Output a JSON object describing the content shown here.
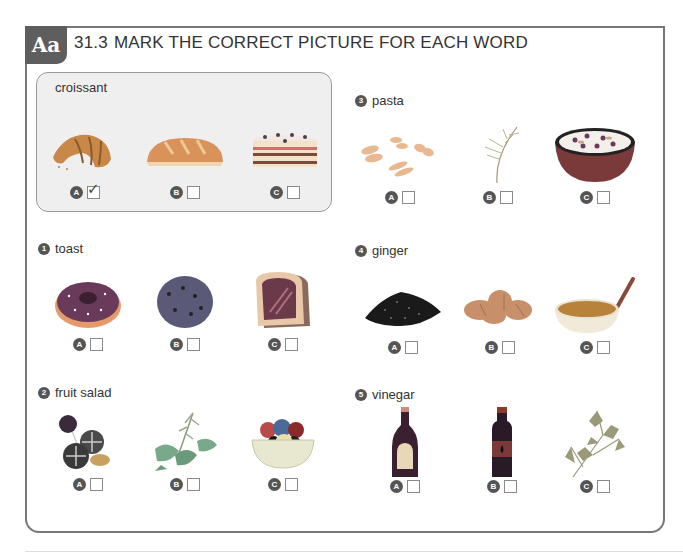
{
  "header": {
    "badge": "Aa",
    "exercise_number": "31.3",
    "instruction": "MARK THE CORRECT PICTURE FOR EACH WORD"
  },
  "example": {
    "word": "croissant",
    "options": [
      {
        "letter": "A",
        "image": "croissant",
        "checked": true
      },
      {
        "letter": "B",
        "image": "bread-loaf",
        "checked": false
      },
      {
        "letter": "C",
        "image": "layer-cake",
        "checked": false
      }
    ],
    "check_mark": "✓"
  },
  "questions": [
    {
      "number": "1",
      "word": "toast",
      "options": [
        {
          "letter": "A",
          "image": "donut",
          "checked": false
        },
        {
          "letter": "B",
          "image": "cookie",
          "checked": false
        },
        {
          "letter": "C",
          "image": "toast-with-jam",
          "checked": false
        }
      ]
    },
    {
      "number": "2",
      "word": "fruit salad",
      "options": [
        {
          "letter": "A",
          "image": "candies",
          "checked": false
        },
        {
          "letter": "B",
          "image": "herbs",
          "checked": false
        },
        {
          "letter": "C",
          "image": "fruit-bowl",
          "checked": false
        }
      ]
    },
    {
      "number": "3",
      "word": "pasta",
      "options": [
        {
          "letter": "A",
          "image": "pasta",
          "checked": false
        },
        {
          "letter": "B",
          "image": "dill",
          "checked": false
        },
        {
          "letter": "C",
          "image": "cereal-bowl",
          "checked": false
        }
      ]
    },
    {
      "number": "4",
      "word": "ginger",
      "options": [
        {
          "letter": "A",
          "image": "ground-pepper",
          "checked": false
        },
        {
          "letter": "B",
          "image": "ginger-root",
          "checked": false
        },
        {
          "letter": "C",
          "image": "soup-bowl",
          "checked": false
        }
      ]
    },
    {
      "number": "5",
      "word": "vinegar",
      "options": [
        {
          "letter": "A",
          "image": "sauce-bottle",
          "checked": false
        },
        {
          "letter": "B",
          "image": "oil-bottle",
          "checked": false
        },
        {
          "letter": "C",
          "image": "parsley",
          "checked": false
        }
      ]
    }
  ]
}
